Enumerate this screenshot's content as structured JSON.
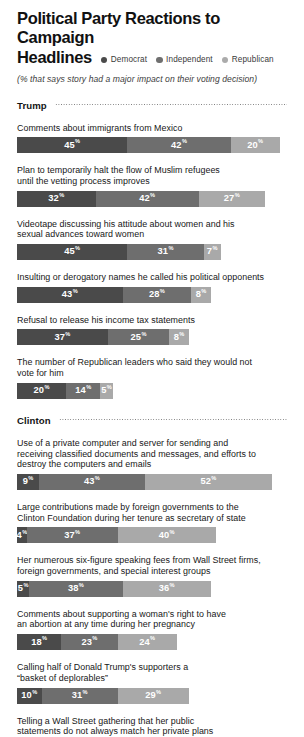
{
  "header": {
    "title_line1": "Political Party Reactions to Campaign",
    "title_line2": "Headlines",
    "subtitle": "(% that says story had a major impact on their voting decision)",
    "legend": [
      {
        "label": "Democrat",
        "color": "#4a4a4a"
      },
      {
        "label": "Independent",
        "color": "#6f6f6f"
      },
      {
        "label": "Republican",
        "color": "#ababab"
      }
    ]
  },
  "colors": {
    "democrat": "#4a4a4a",
    "independent": "#6e6e6e",
    "republican": "#a9a9a9",
    "text": "#171717",
    "background": "#ffffff"
  },
  "chart_data": {
    "type": "bar",
    "title": "Political Party Reactions to Campaign Headlines",
    "subtitle": "(% that says story had a major impact on their voting decision)",
    "orientation": "horizontal-stacked",
    "unit": "%",
    "xlabel": "",
    "ylabel": "",
    "grid": false,
    "legend_position": "top-right",
    "series": [
      {
        "name": "Democrat",
        "color": "#4a4a4a"
      },
      {
        "name": "Independent",
        "color": "#6e6e6e"
      },
      {
        "name": "Republican",
        "color": "#a9a9a9"
      }
    ],
    "sections": [
      {
        "name": "Trump",
        "items": [
          {
            "label": "Comments about immigrants from Mexico",
            "values": [
              45,
              42,
              20
            ],
            "display": [
              "45",
              "42",
              "20"
            ]
          },
          {
            "label": "Plan to temporarily halt the flow of Muslim refugees\nuntil the vetting process improves",
            "values": [
              32,
              42,
              27
            ],
            "display": [
              "32",
              "42",
              "27"
            ]
          },
          {
            "label": "Videotape discussing his attitude about women and his\nsexual advances toward women",
            "values": [
              45,
              31,
              7
            ],
            "display": [
              "45",
              "31",
              "7"
            ]
          },
          {
            "label": "Insulting or derogatory names he called his political opponents",
            "values": [
              43,
              28,
              8
            ],
            "display": [
              "43",
              "28",
              "8"
            ]
          },
          {
            "label": "Refusal to release his income tax statements",
            "values": [
              37,
              25,
              8
            ],
            "display": [
              "37",
              "25",
              "8"
            ]
          },
          {
            "label": "The number of Republican leaders who said they would not\nvote for him",
            "values": [
              20,
              14,
              5
            ],
            "display": [
              "20",
              "14",
              "5"
            ]
          }
        ]
      },
      {
        "name": "Clinton",
        "items": [
          {
            "label": "Use of a private computer and server for sending and\nreceiving classified documents and messages, and efforts to\ndestroy the computers and emails",
            "values": [
              9,
              43,
              52
            ],
            "display": [
              "9",
              "43",
              "52"
            ]
          },
          {
            "label": "Large contributions made by foreign governments to the\nClinton Foundation during her tenure as secretary of state",
            "values": [
              4,
              37,
              40
            ],
            "display": [
              "4",
              "37",
              "40"
            ]
          },
          {
            "label": "Her numerous six-figure speaking fees from Wall Street firms,\nforeign governments, and special interest groups",
            "values": [
              5,
              38,
              36
            ],
            "display": [
              "5",
              "38",
              "36"
            ]
          },
          {
            "label": "Comments about supporting a woman's right to have\nan abortion at any time during her pregnancy",
            "values": [
              18,
              23,
              24
            ],
            "display": [
              "18",
              "23",
              "24"
            ]
          },
          {
            "label": "Calling half of Donald Trump's supporters a\n“basket of deplorables”",
            "values": [
              10,
              31,
              29
            ],
            "display": [
              "10",
              "31",
              "29"
            ]
          },
          {
            "label": "Telling a Wall Street gathering that her public\nstatements do not always match her private plans",
            "values": [],
            "display": []
          }
        ]
      }
    ]
  }
}
